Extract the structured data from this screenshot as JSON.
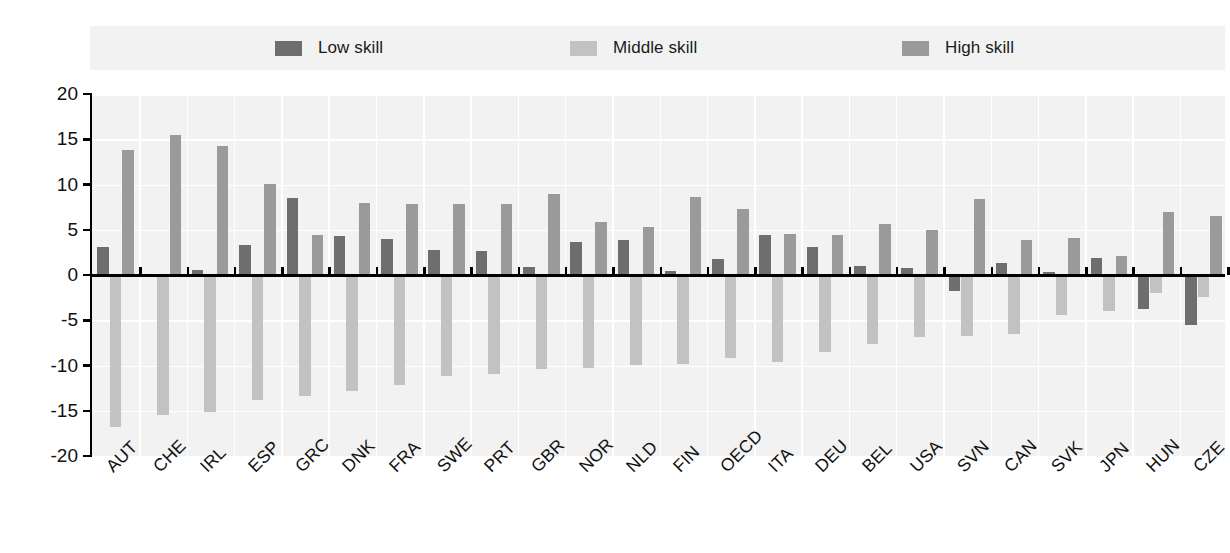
{
  "legend": {
    "items": [
      {
        "label": "Low skill",
        "color": "#6e6e6e",
        "key": "low"
      },
      {
        "label": "Middle skill",
        "color": "#c2c2c2",
        "key": "middle"
      },
      {
        "label": "High skill",
        "color": "#9a9a9a",
        "key": "high"
      }
    ]
  },
  "axes": {
    "y_ticks": [
      "20",
      "15",
      "10",
      "5",
      "0",
      "-5",
      "-10",
      "-15",
      "-20"
    ]
  },
  "colors": {
    "low_skill": "#6e6e6e",
    "middle_skill": "#c2c2c2",
    "high_skill": "#9a9a9a",
    "plot_background": "#f2f2f2",
    "gridline": "#ffffff",
    "axis": "#000000"
  },
  "chart_data": {
    "type": "bar",
    "title": "",
    "xlabel": "",
    "ylabel": "",
    "ylim": [
      -20,
      20
    ],
    "yticks": [
      20,
      15,
      10,
      5,
      0,
      -5,
      -10,
      -15,
      -20
    ],
    "grid": true,
    "legend_position": "top",
    "categories": [
      "AUT",
      "CHE",
      "IRL",
      "ESP",
      "GRC",
      "DNK",
      "FRA",
      "SWE",
      "PRT",
      "GBR",
      "NOR",
      "NLD",
      "FIN",
      "OECD",
      "ITA",
      "DEU",
      "BEL",
      "USA",
      "SVN",
      "CAN",
      "SVK",
      "JPN",
      "HUN",
      "CZE"
    ],
    "series": [
      {
        "name": "Low skill",
        "color": "#6e6e6e",
        "values": [
          3.1,
          0.1,
          0.6,
          3.3,
          8.5,
          4.3,
          4.0,
          2.8,
          2.6,
          0.9,
          3.7,
          3.9,
          0.4,
          1.8,
          4.4,
          3.1,
          1.0,
          0.8,
          -1.8,
          1.3,
          0.3,
          1.9,
          -3.8,
          -5.5
        ]
      },
      {
        "name": "Middle skill",
        "color": "#c2c2c2",
        "values": [
          -16.8,
          -15.5,
          -15.1,
          -13.8,
          -13.4,
          -12.8,
          -12.2,
          -11.2,
          -10.9,
          -10.4,
          -10.3,
          -9.9,
          -9.8,
          -9.2,
          -9.6,
          -8.5,
          -7.6,
          -6.8,
          -6.7,
          -6.5,
          -4.4,
          -4.0,
          -2.0,
          -2.4
        ]
      },
      {
        "name": "High skill",
        "color": "#9a9a9a",
        "values": [
          13.8,
          15.5,
          14.3,
          10.1,
          4.4,
          8.0,
          7.8,
          7.8,
          7.8,
          8.9,
          5.9,
          5.3,
          8.6,
          7.3,
          4.5,
          4.4,
          5.6,
          5.0,
          8.4,
          3.9,
          4.1,
          2.1,
          7.0,
          6.5
        ]
      }
    ]
  }
}
